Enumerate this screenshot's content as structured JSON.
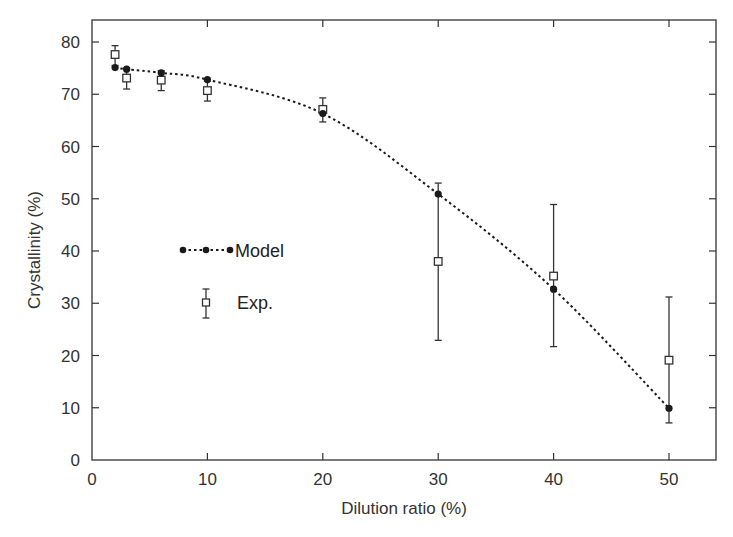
{
  "chart_data": {
    "type": "scatter",
    "title": "",
    "xlabel": "Dilution ratio (%)",
    "ylabel": "Crystallinity (%)",
    "xlim": [
      0,
      54
    ],
    "ylim": [
      0,
      84
    ],
    "xticks": [
      0,
      10,
      20,
      30,
      40,
      50
    ],
    "yticks": [
      0,
      10,
      20,
      30,
      40,
      50,
      60,
      70,
      80
    ],
    "grid": false,
    "legend_position": "inside-center-left",
    "series": [
      {
        "name": "Model",
        "style": "dotted line with filled circle markers",
        "x": [
          2,
          3,
          6,
          10,
          20,
          30,
          40,
          50
        ],
        "y": [
          75.1,
          74.8,
          74.1,
          72.8,
          66.3,
          50.9,
          32.7,
          9.9
        ]
      },
      {
        "name": "Exp.",
        "style": "open square markers with error bars",
        "x": [
          2,
          3,
          6,
          10,
          20,
          30,
          40,
          50
        ],
        "y": [
          77.6,
          73.1,
          72.7,
          70.7,
          67.1,
          38.0,
          35.2,
          19.1
        ],
        "y_err_low": [
          75.5,
          71.0,
          70.7,
          68.7,
          64.7,
          22.9,
          21.7,
          7.1
        ],
        "y_err_high": [
          79.3,
          75.0,
          74.5,
          72.5,
          69.3,
          53.0,
          48.9,
          31.2
        ]
      }
    ]
  },
  "labels": {
    "xlabel": "Dilution ratio (%)",
    "ylabel": "Crystallinity (%)",
    "legend_model": "Model",
    "legend_exp": "Exp."
  },
  "colors": {
    "axis": "#333333",
    "model": "#1a1a1a",
    "exp": "#333333"
  }
}
